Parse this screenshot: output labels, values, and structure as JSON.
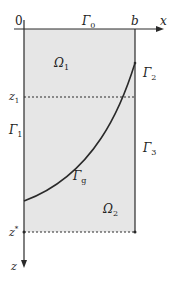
{
  "diagram": {
    "origin_label": "0",
    "x_axis_label": "x",
    "z_axis_label": "z",
    "b_label": "b",
    "z1_label": "z",
    "z1_sub": "1",
    "zstar_label": "z",
    "zstar_sup": "*",
    "boundaries": {
      "gamma0": {
        "sym": "Γ",
        "sub": "0"
      },
      "gamma1": {
        "sym": "Γ",
        "sub": "1"
      },
      "gamma2": {
        "sym": "Γ",
        "sub": "2"
      },
      "gamma3": {
        "sym": "Γ",
        "sub": "3"
      },
      "gammag": {
        "sym": "Γ",
        "sub": "g"
      }
    },
    "regions": {
      "omega1": {
        "sym": "Ω",
        "sub": "1"
      },
      "omega2": {
        "sym": "Ω",
        "sub": "2"
      }
    },
    "colors": {
      "fill": "#e6e6e6",
      "line": "#2a2a2a"
    }
  }
}
